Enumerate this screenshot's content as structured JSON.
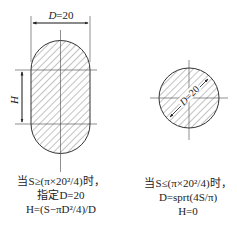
{
  "left_figure": {
    "dimension_label": "D=20",
    "height_label": "H",
    "caption": [
      "当S≥(π×20²/4)时，",
      "指定D=20",
      "H=(S−πD²/4)/D"
    ]
  },
  "right_figure": {
    "dimension_label": "D=20",
    "caption": [
      "当S≤(π×20²/4)时，",
      "D=sprt(4S/π)",
      "H=0"
    ]
  },
  "colors": {
    "line": "#333333",
    "hatch": "#555555",
    "background": "#ffffff"
  }
}
